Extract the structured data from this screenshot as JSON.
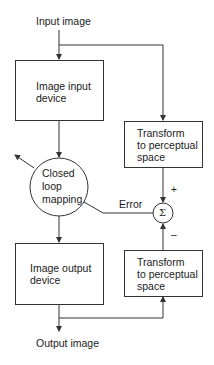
{
  "diagram": {
    "input_label": "Input image",
    "output_label": "Output image",
    "nodes": {
      "input_device": {
        "line1": "Image input",
        "line2": "device"
      },
      "output_device": {
        "line1": "Image output",
        "line2": "device"
      },
      "mapping": {
        "line1": "Closed",
        "line2": "loop",
        "line3": "mapping"
      },
      "transform_top": {
        "line1": "Transform",
        "line2": "to perceptual",
        "line3": "space"
      },
      "transform_bottom": {
        "line1": "Transform",
        "line2": "to perceptual",
        "line3": "space"
      },
      "summer": {
        "symbol": "Σ"
      }
    },
    "edge_labels": {
      "error": "Error",
      "plus": "+",
      "minus": "–"
    }
  },
  "colors": {
    "stroke": "#333333",
    "text": "#1a1a1a",
    "background": "#ffffff"
  }
}
